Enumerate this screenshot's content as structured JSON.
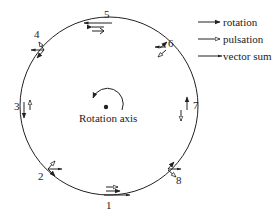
{
  "diagram": {
    "center_label": "Rotation axis",
    "points": [
      {
        "id": "1",
        "label": "1"
      },
      {
        "id": "2",
        "label": "2"
      },
      {
        "id": "3",
        "label": "3"
      },
      {
        "id": "4",
        "label": "4"
      },
      {
        "id": "5",
        "label": "5"
      },
      {
        "id": "6",
        "label": "6"
      },
      {
        "id": "7",
        "label": "7"
      },
      {
        "id": "8",
        "label": "8"
      }
    ],
    "legend": [
      {
        "key": "rotation",
        "label": "rotation",
        "marker": "filled-arrow"
      },
      {
        "key": "pulsation",
        "label": "pulsation",
        "marker": "open-arrow"
      },
      {
        "key": "vector_sum",
        "label": "vector sum",
        "marker": "line-arrow"
      }
    ],
    "colors": {
      "stroke": "#222222",
      "background": "#ffffff"
    }
  }
}
